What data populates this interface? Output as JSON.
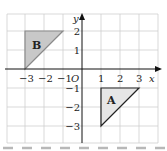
{
  "diagram": {
    "type": "coordinate-grid",
    "axes": {
      "x_label": "x",
      "y_label": "y",
      "origin_label": "O"
    },
    "x_ticks": [
      "−3",
      "−2",
      "−1",
      "1",
      "2",
      "3"
    ],
    "y_ticks": [
      "2",
      "1",
      "−1",
      "−2",
      "−3"
    ],
    "shapes": [
      {
        "label": "A",
        "vertices": [
          [
            1,
            -1
          ],
          [
            3,
            -1
          ],
          [
            1,
            -3
          ]
        ],
        "fill": "#e6e6e6",
        "stroke": "#222222"
      },
      {
        "label": "B",
        "vertices": [
          [
            -3,
            0
          ],
          [
            -3,
            2
          ],
          [
            -1,
            2
          ]
        ],
        "fill": "#c8c8c8",
        "stroke": "#888888"
      }
    ],
    "colors": {
      "grid": "#cfcfcf",
      "axis": "#111111",
      "dash": "#b8b8b8"
    }
  }
}
